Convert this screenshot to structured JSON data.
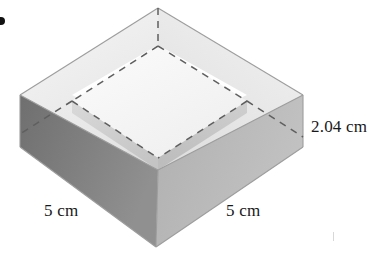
{
  "figure": {
    "kind": "isometric-open-box-diagram",
    "alt_description": "Gray shaded isometric drawing of a square open box with hidden edges shown as dashed lines",
    "dimensions": {
      "height_label": "2.04 cm",
      "width_left_label": "5 cm",
      "width_right_label": "5 cm"
    },
    "colors": {
      "background": "#ffffff",
      "top_face_left": "#efefef",
      "top_face_right": "#e6e6e6",
      "cavity_floor": "#f8f8f8",
      "front_face_left": "#828282",
      "front_face_right": "#b6b6b6",
      "inner_wall_left": "#d2d2d2",
      "inner_wall_right": "#c6c6c6",
      "outline": "#9a9a9a",
      "hidden_edge": "#6f6f6f",
      "label_text": "#17181a",
      "bullet": "#121212"
    },
    "geometry": {
      "apex_back": [
        158,
        8
      ],
      "vertex_left": [
        20,
        95
      ],
      "vertex_right": [
        303,
        95
      ],
      "vertex_front_top": [
        158,
        170
      ],
      "vertex_front_bottom": [
        156,
        247
      ],
      "vertex_left_bottom": [
        20,
        147
      ],
      "vertex_right_bottom": [
        303,
        147
      ],
      "wall_thickness_px": 34,
      "side_height_px": 52
    },
    "markers": {
      "bullet_icon": "bullet-dot",
      "bullet_visible": true
    }
  }
}
